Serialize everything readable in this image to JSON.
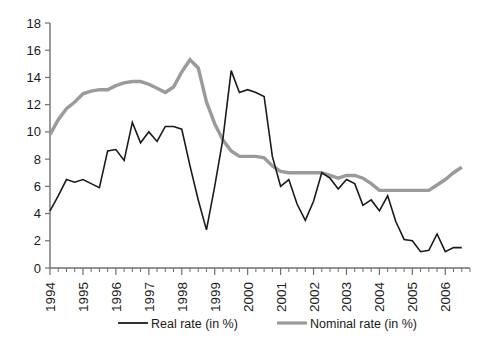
{
  "chart_data": {
    "type": "line",
    "title": "",
    "subtitle": "",
    "xlabel": "",
    "ylabel": "",
    "xlim": [
      1994.0,
      2006.75
    ],
    "ylim": [
      0,
      18
    ],
    "yticks": [
      0,
      2,
      4,
      6,
      8,
      10,
      12,
      14,
      16,
      18
    ],
    "xticks": [
      1994,
      1995,
      1996,
      1997,
      1998,
      1999,
      2000,
      2001,
      2002,
      2003,
      2004,
      2005,
      2006
    ],
    "xtick_labels": [
      "1994",
      "1995",
      "1996",
      "1997",
      "1998",
      "1999",
      "2000",
      "2001",
      "2002",
      "2003",
      "2004",
      "2005",
      "2006"
    ],
    "grid": false,
    "legend_position": "bottom",
    "minor_ticks_per_year": 4,
    "x": [
      1994.0,
      1994.25,
      1994.5,
      1994.75,
      1995.0,
      1995.25,
      1995.5,
      1995.75,
      1996.0,
      1996.25,
      1996.5,
      1996.75,
      1997.0,
      1997.25,
      1997.5,
      1997.75,
      1998.0,
      1998.25,
      1998.5,
      1998.75,
      1999.0,
      1999.25,
      1999.5,
      1999.75,
      2000.0,
      2000.25,
      2000.5,
      2000.75,
      2001.0,
      2001.25,
      2001.5,
      2001.75,
      2002.0,
      2002.25,
      2002.5,
      2002.75,
      2003.0,
      2003.25,
      2003.5,
      2003.75,
      2004.0,
      2004.25,
      2004.5,
      2004.75,
      2005.0,
      2005.25,
      2005.5,
      2005.75,
      2006.0,
      2006.25,
      2006.5
    ],
    "series": [
      {
        "name": "Real rate (in %)",
        "color": "#1a1a1a",
        "width": 1.6,
        "values": [
          4.2,
          5.3,
          6.5,
          6.3,
          6.5,
          6.2,
          5.9,
          8.6,
          8.7,
          7.9,
          10.7,
          9.2,
          10.0,
          9.3,
          10.4,
          10.4,
          10.2,
          7.5,
          5.0,
          2.8,
          6.0,
          9.5,
          14.5,
          12.9,
          13.1,
          12.9,
          12.6,
          8.2,
          6.0,
          6.5,
          4.7,
          3.5,
          4.9,
          7.0,
          6.6,
          5.8,
          6.5,
          6.2,
          4.6,
          5.0,
          4.2,
          5.3,
          3.4,
          2.1,
          2.0,
          1.2,
          1.3,
          2.5,
          1.2,
          1.5,
          1.5
        ]
      },
      {
        "name": "Nominal rate (in %)",
        "color": "#9a9a9a",
        "width": 3.4,
        "values": [
          9.8,
          10.9,
          11.7,
          12.2,
          12.8,
          13.0,
          13.1,
          13.1,
          13.4,
          13.6,
          13.7,
          13.7,
          13.5,
          13.2,
          12.9,
          13.3,
          14.4,
          15.3,
          14.7,
          12.2,
          10.6,
          9.4,
          8.6,
          8.2,
          8.2,
          8.2,
          8.1,
          7.5,
          7.1,
          7.0,
          7.0,
          7.0,
          7.0,
          7.0,
          6.8,
          6.6,
          6.8,
          6.8,
          6.6,
          6.2,
          5.7,
          5.7,
          5.7,
          5.7,
          5.7,
          5.7,
          5.7,
          6.1,
          6.5,
          7.0,
          7.4
        ]
      }
    ]
  },
  "legend": {
    "items": [
      {
        "label": "Real rate (in %)",
        "color": "#1a1a1a",
        "width": 1.8
      },
      {
        "label": "Nominal rate (in %)",
        "color": "#9a9a9a",
        "width": 3.2
      }
    ]
  },
  "axes": {
    "y_tick_labels": [
      "0",
      "2",
      "4",
      "6",
      "8",
      "10",
      "12",
      "14",
      "16",
      "18"
    ],
    "x_tick_labels": [
      "1994",
      "1995",
      "1996",
      "1997",
      "1998",
      "1999",
      "2000",
      "2001",
      "2002",
      "2003",
      "2004",
      "2005",
      "2006"
    ]
  }
}
